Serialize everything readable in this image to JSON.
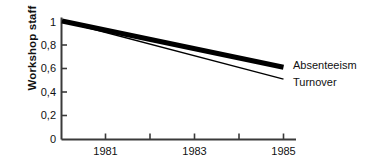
{
  "chart_data": {
    "type": "line",
    "title": "",
    "xlabel": "",
    "ylabel": "Workshop staff",
    "xlim": [
      1980,
      1985
    ],
    "ylim": [
      0,
      1
    ],
    "grid": false,
    "legend_position": "right-of-line-ends",
    "x": [
      1980,
      1985
    ],
    "x_ticks": [
      1981,
      1982,
      1983,
      1984,
      1985
    ],
    "x_tick_labels": [
      "1981",
      "",
      "1983",
      "",
      "1985"
    ],
    "y_ticks": [
      0,
      0.2,
      0.4,
      0.6,
      0.8,
      1
    ],
    "y_tick_labels": [
      "0",
      "0,2",
      "0,4",
      "0,6",
      "0,8",
      "1"
    ],
    "series": [
      {
        "name": "Absenteeism",
        "values": [
          1.0,
          0.61
        ],
        "style": "thick-solid",
        "color": "#000000",
        "line_width": 5
      },
      {
        "name": "Turnover",
        "values": [
          1.0,
          0.51
        ],
        "style": "thin-solid",
        "color": "#000000",
        "line_width": 1.3
      }
    ]
  },
  "axes": {
    "y_title": "Workshop staff",
    "y_labels": [
      "1",
      "0,8",
      "0,6",
      "0,4",
      "0,2",
      "0"
    ],
    "x_labels": [
      "1981",
      "1983",
      "1985"
    ]
  },
  "series_labels": {
    "absenteeism": "Absenteeism",
    "turnover": "Turnover"
  },
  "colors": {
    "axis": "#3a3a3a",
    "line": "#000000",
    "text": "#111111",
    "background": "#ffffff"
  }
}
